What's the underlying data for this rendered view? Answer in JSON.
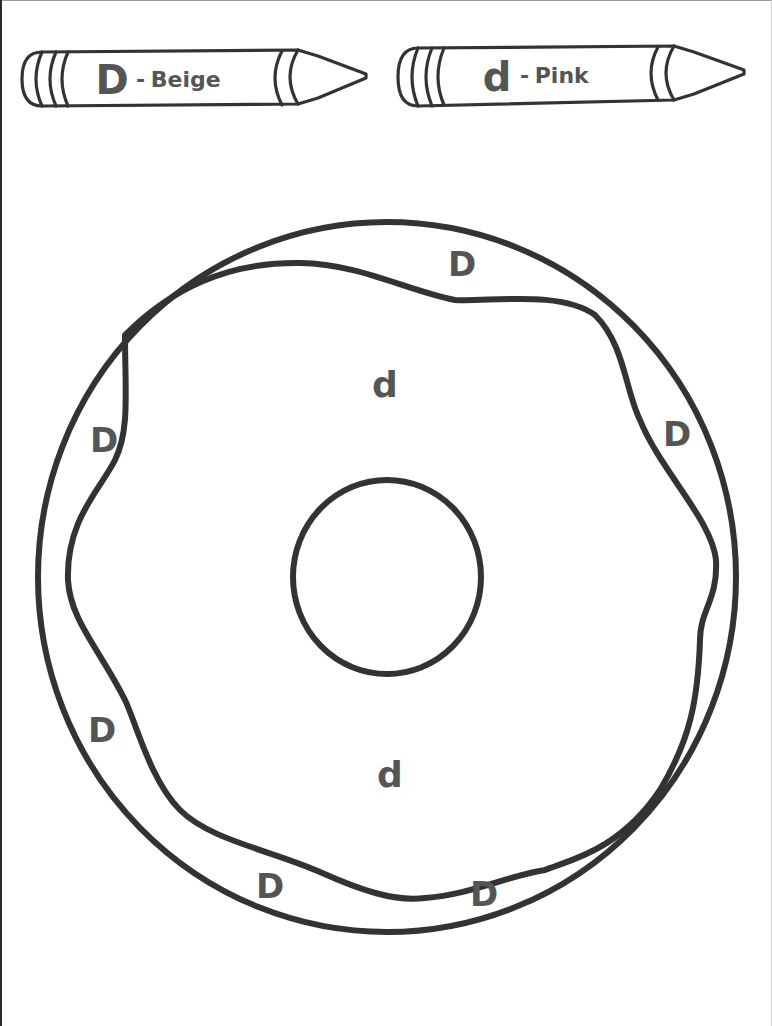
{
  "worksheet": {
    "key": [
      {
        "letter": "D",
        "separator": "-",
        "color_name": "Beige",
        "color_hex": "#F5F5DC"
      },
      {
        "letter": "d",
        "separator": "-",
        "color_name": "Pink",
        "color_hex": "#FFC0CB"
      }
    ],
    "outer_ring_marks": [
      {
        "letter": "D"
      },
      {
        "letter": "D"
      },
      {
        "letter": "D"
      },
      {
        "letter": "D"
      },
      {
        "letter": "D"
      },
      {
        "letter": "D"
      }
    ],
    "frosting_marks": [
      {
        "letter": "d"
      },
      {
        "letter": "d"
      }
    ]
  },
  "colors": {
    "line": "#333333",
    "letter": "#555555",
    "background": "#FFFFFF"
  }
}
